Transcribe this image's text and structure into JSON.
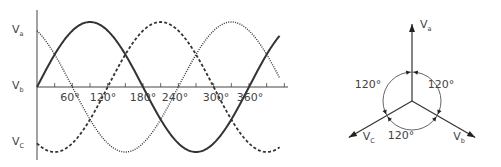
{
  "waveform": {
    "origin": {
      "x": 37,
      "y": 87
    },
    "amplitude_px": 65,
    "px_per_degree": 0.5889,
    "x_axis_end": 288,
    "y_axis": {
      "top": 10,
      "bottom": 160
    },
    "theta_end_deg": 412,
    "series": [
      {
        "name": "Va",
        "phase_deg": 120,
        "style": "dotted"
      },
      {
        "name": "Vb",
        "phase_deg": 0,
        "style": "solid"
      },
      {
        "name": "Vc",
        "phase_deg": -120,
        "style": "dashed"
      }
    ],
    "y_labels": [
      {
        "main": "V",
        "sub": "a",
        "y": 31
      },
      {
        "main": "V",
        "sub": "b",
        "y": 87
      },
      {
        "main": "V",
        "sub": "C",
        "y": 143
      }
    ],
    "x_tick_labels": [
      {
        "text": "60°",
        "x": 70
      },
      {
        "text": "120°",
        "x": 103
      },
      {
        "text": "180°",
        "x": 143
      },
      {
        "text": "240°",
        "x": 175
      },
      {
        "text": "300°",
        "x": 216
      },
      {
        "text": "360°",
        "x": 250
      }
    ],
    "tick_spacing_deg": 30
  },
  "phasor": {
    "center": {
      "x": 412,
      "y": 101
    },
    "arc_radius": 29,
    "vectors": [
      {
        "name": "Va",
        "main": "V",
        "sub": "a",
        "angle_deg": 90,
        "length": 77,
        "label_dx": 8,
        "label_dy": 4
      },
      {
        "name": "Vb",
        "main": "V",
        "sub": "b",
        "angle_deg": -30,
        "length": 73,
        "label_dx": -22,
        "label_dy": 2
      },
      {
        "name": "Vc",
        "main": "V",
        "sub": "C",
        "angle_deg": 210,
        "length": 73,
        "label_dx": 14,
        "label_dy": 2
      }
    ],
    "angle_labels": [
      {
        "text": "120°",
        "x": 368,
        "y": 88
      },
      {
        "text": "120°",
        "x": 441,
        "y": 88
      },
      {
        "text": "120°",
        "x": 401,
        "y": 139
      }
    ]
  }
}
